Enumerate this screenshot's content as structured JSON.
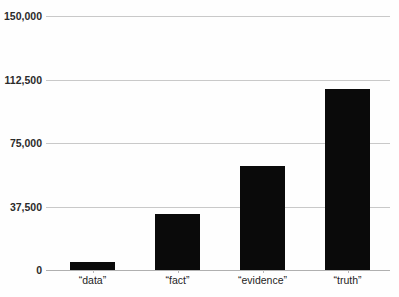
{
  "chart_data": {
    "type": "bar",
    "title": "",
    "subtitle": "",
    "xlabel": "",
    "ylabel": "",
    "categories": [
      "“data”",
      "“fact”",
      "“evidence”",
      "“truth”"
    ],
    "values": [
      5000,
      33000,
      61500,
      107000
    ],
    "series": [
      {
        "name": "count",
        "values": [
          5000,
          33000,
          61500,
          107000
        ]
      }
    ],
    "ylim": [
      0,
      150000
    ],
    "ytick_values": [
      0,
      37500,
      75000,
      112500,
      150000
    ],
    "ytick_labels": [
      "0",
      "37,500",
      "75,000",
      "112,500",
      "150,000"
    ],
    "grid": "horizontal",
    "legend": "none",
    "bar_color": "#0a0a0a",
    "gridline_color": "#c9c9c9",
    "axis_color": "#b0b0b0",
    "background_color": "#fefefe",
    "tick_label_color": "#2b2b2b",
    "category_label_color": "#1d1d1d"
  }
}
